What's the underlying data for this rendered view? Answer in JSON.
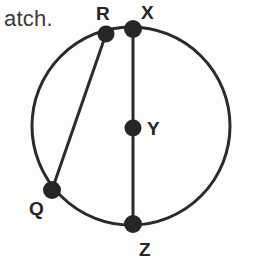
{
  "figure": {
    "title_fragment": "atch.",
    "background_color": "#fdfdfb",
    "stroke_color": "#2b2b2b",
    "label_color": "#262626",
    "fragment_color": "#3a3a3a",
    "stroke_width": 3,
    "dot_radius": 8,
    "circle": {
      "center_x": 131,
      "center_y": 126,
      "radius": 99
    },
    "points": [
      {
        "id": "R",
        "label": "R",
        "x": 106,
        "y": 34,
        "label_x": 96,
        "label_y": 4
      },
      {
        "id": "X",
        "label": "X",
        "x": 133,
        "y": 29,
        "label_x": 141,
        "label_y": 3
      },
      {
        "id": "Y",
        "label": "Y",
        "x": 133,
        "y": 128,
        "label_x": 147,
        "label_y": 119
      },
      {
        "id": "Q",
        "label": "Q",
        "x": 52,
        "y": 190,
        "label_x": 29,
        "label_y": 199
      },
      {
        "id": "Z",
        "label": "Z",
        "x": 133,
        "y": 224,
        "label_x": 139,
        "label_y": 240
      }
    ],
    "segments": [
      {
        "id": "XZ",
        "from": "X",
        "to": "Z",
        "x1": 133,
        "y1": 29,
        "x2": 133,
        "y2": 224
      },
      {
        "id": "RQ",
        "from": "R",
        "to": "Q",
        "x1": 106,
        "y1": 34,
        "x2": 52,
        "y2": 190
      }
    ]
  }
}
